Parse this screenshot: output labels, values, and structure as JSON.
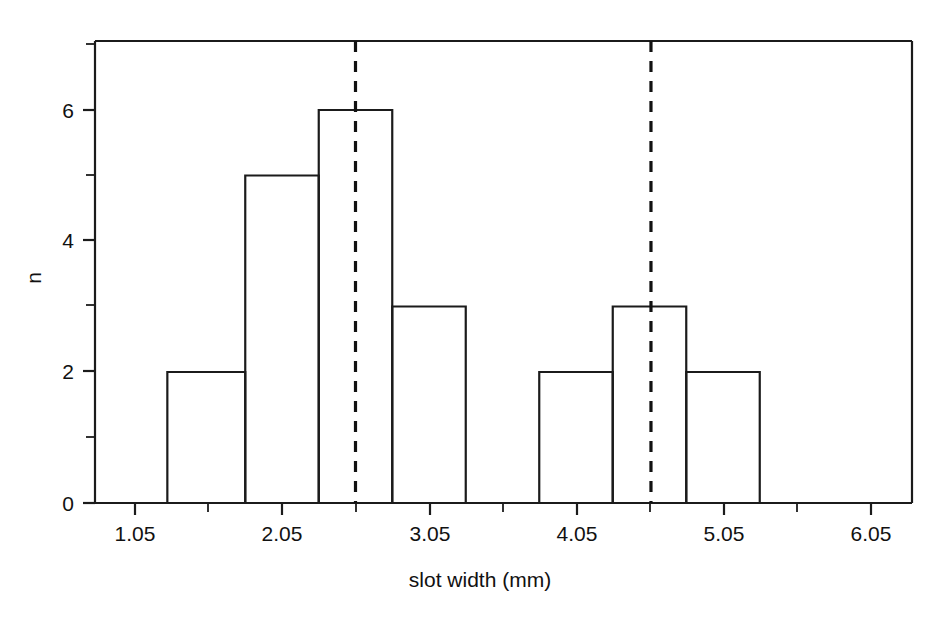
{
  "chart_data": {
    "type": "bar",
    "title": "",
    "subtitle": "",
    "xlabel": "slot width (mm)",
    "ylabel": "n",
    "xlim": [
      0.75,
      6.55
    ],
    "ylim": [
      0,
      7
    ],
    "grid": false,
    "legend": null,
    "x_ticks_major": [
      1.05,
      2.05,
      3.05,
      4.05,
      5.05,
      6.05
    ],
    "x_tick_labels": [
      "1.05",
      "2.05",
      "3.05",
      "4.05",
      "5.05",
      "6.05"
    ],
    "x_ticks_minor": [
      1.55,
      2.55,
      3.55,
      4.55,
      5.55
    ],
    "y_ticks_major": [
      0,
      2,
      4,
      6
    ],
    "y_tick_labels": [
      "0",
      "2",
      "4",
      "6"
    ],
    "y_ticks_minor": [
      1,
      3,
      5,
      7
    ],
    "bin_edges": [
      1.27,
      1.8,
      2.3,
      2.8,
      3.3,
      3.8,
      4.3,
      4.8,
      5.3
    ],
    "bins": [
      {
        "left": 1.27,
        "right": 1.8,
        "count": 2
      },
      {
        "left": 1.8,
        "right": 2.3,
        "count": 5
      },
      {
        "left": 2.3,
        "right": 2.8,
        "count": 6
      },
      {
        "left": 2.8,
        "right": 3.3,
        "count": 3
      },
      {
        "left": 3.8,
        "right": 4.3,
        "count": 2
      },
      {
        "left": 4.3,
        "right": 4.8,
        "count": 3
      },
      {
        "left": 4.8,
        "right": 5.3,
        "count": 2
      }
    ],
    "categories": [
      "1.27-1.80",
      "1.80-2.30",
      "2.30-2.80",
      "2.80-3.30",
      "3.80-4.30",
      "4.30-4.80",
      "4.80-5.30"
    ],
    "values": [
      2,
      5,
      6,
      3,
      2,
      3,
      2
    ],
    "annotations": [
      {
        "type": "vertical-dashed-line",
        "x": 2.55,
        "label": ""
      },
      {
        "type": "vertical-dashed-line",
        "x": 4.56,
        "label": ""
      }
    ]
  },
  "axes": {
    "x_title": "slot width (mm)",
    "y_title": "n"
  }
}
